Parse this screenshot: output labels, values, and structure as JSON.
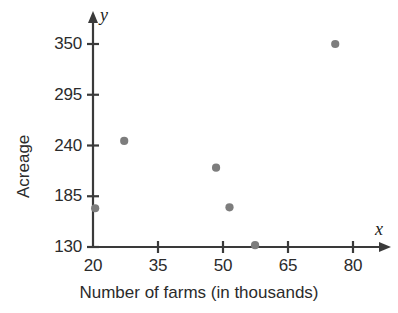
{
  "chart_data": {
    "type": "scatter",
    "title": "",
    "xlabel": "Number of farms (in thousands)",
    "ylabel": "Acreage",
    "x_axis_symbol": "x",
    "y_axis_symbol": "y",
    "xlim": [
      20,
      85
    ],
    "ylim": [
      130,
      360
    ],
    "xticks": [
      20,
      35,
      50,
      65,
      80
    ],
    "yticks": [
      130,
      185,
      240,
      295,
      350
    ],
    "xtick_labels": [
      "20",
      "35",
      "50",
      "65",
      "80"
    ],
    "ytick_labels": [
      "130",
      "185",
      "240",
      "295",
      "350"
    ],
    "grid": false,
    "legend": null,
    "series": [
      {
        "name": "farms vs acreage",
        "color": "#7d7d7d",
        "points": [
          {
            "x": 27.2,
            "y": 245
          },
          {
            "x": 20.5,
            "y": 172
          },
          {
            "x": 48.4,
            "y": 216
          },
          {
            "x": 51.5,
            "y": 173
          },
          {
            "x": 57.4,
            "y": 132
          },
          {
            "x": 75.9,
            "y": 350
          }
        ]
      }
    ]
  },
  "style": {
    "axis_color": "#3a3a3a",
    "dot_color": "#7d7d7d",
    "text_color": "#2b2b2b",
    "background": "#ffffff"
  }
}
